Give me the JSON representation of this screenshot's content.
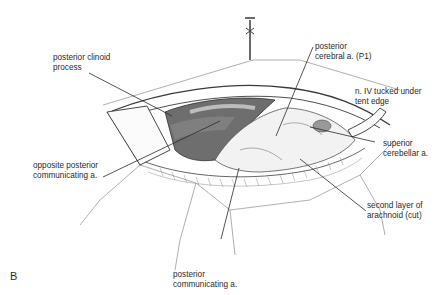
{
  "figure": {
    "panel_letter": "B",
    "labels": {
      "posterior_clinoid": "posterior clinoid\nprocess",
      "posterior_cerebral": "posterior\ncerebral a. (P1)",
      "n_iv": "n. IV tucked under\ntent edge",
      "superior_cerebellar": "superior\ncerebellar a.",
      "opposite_pcomm": "opposite posterior\ncommunicating a.",
      "second_layer": "second layer of\narachnoid (cut)",
      "posterior_comm": "posterior\ncommunicating a."
    },
    "colors": {
      "ink": "#2a2a2a",
      "shadow": "#6e6e6e",
      "mid": "#9a9a9a",
      "light": "#d8d8d8",
      "paper": "#ffffff"
    }
  }
}
